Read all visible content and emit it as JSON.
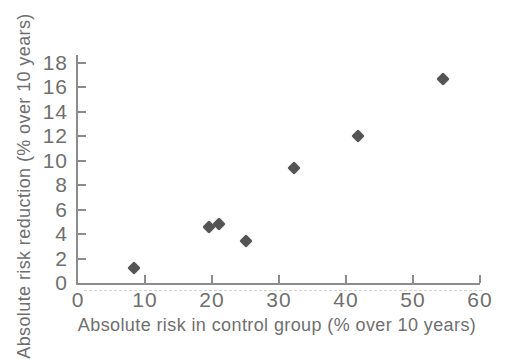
{
  "figure": {
    "background_color": "#ffffff",
    "text_color": "#6f6f6f",
    "axis_color": "#8c8c8c",
    "marker_color": "#545454"
  },
  "chart_data": {
    "type": "scatter",
    "title": "",
    "xlabel": "Absolute risk in control group (% over 10 years)",
    "ylabel": "Absolute risk reduction (% over 10 years)",
    "xlim": [
      0,
      60
    ],
    "ylim": [
      0,
      18
    ],
    "x_ticks": [
      0,
      10,
      20,
      30,
      40,
      50,
      60
    ],
    "y_ticks": [
      0,
      2,
      4,
      6,
      8,
      10,
      12,
      14,
      16,
      18
    ],
    "grid": false,
    "legend": false,
    "marker_shape": "diamond",
    "points": [
      {
        "x": 8.3,
        "y": 1.2
      },
      {
        "x": 19.6,
        "y": 4.6
      },
      {
        "x": 21.0,
        "y": 4.8
      },
      {
        "x": 25.1,
        "y": 3.4
      },
      {
        "x": 32.2,
        "y": 9.4
      },
      {
        "x": 41.8,
        "y": 12.0
      },
      {
        "x": 54.5,
        "y": 16.7
      }
    ]
  }
}
